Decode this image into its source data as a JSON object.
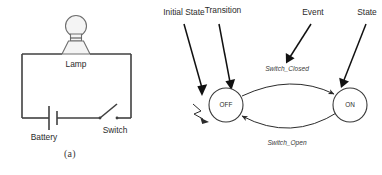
{
  "figure": {
    "panels": [
      {
        "id": "circuit",
        "caption": "(a)",
        "component_labels": {
          "lamp": "Lamp",
          "battery": "Battery",
          "switch": "Switch"
        }
      },
      {
        "id": "state-machine",
        "caption": "(b)",
        "states": [
          {
            "id": "off",
            "label": "OFF"
          },
          {
            "id": "on",
            "label": "ON"
          }
        ],
        "transitions": [
          {
            "id": "off-to-on",
            "label": "Switch_Closed",
            "from": "OFF",
            "to": "ON"
          },
          {
            "id": "on-to-off",
            "label": "Switch_Open",
            "from": "ON",
            "to": "OFF"
          }
        ],
        "annotations": [
          {
            "id": "initial-state",
            "label": "Initial State"
          },
          {
            "id": "transition",
            "label": "Transition"
          },
          {
            "id": "event",
            "label": "Event"
          },
          {
            "id": "state",
            "label": "State"
          }
        ]
      }
    ]
  },
  "colors": {
    "ink": "#2b2b2b",
    "line": "#404040",
    "bulb_fill": "#f4f4f4",
    "background": "#ffffff"
  }
}
